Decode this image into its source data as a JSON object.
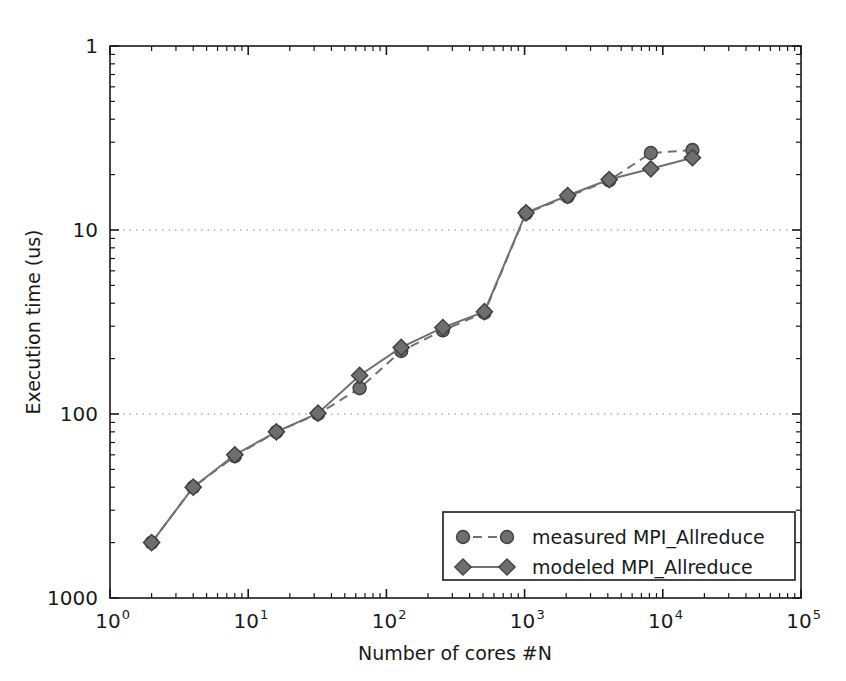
{
  "chart_data": {
    "type": "line",
    "title": "",
    "xlabel": "Number of cores #N",
    "ylabel": "Execution time (us)",
    "xscale": "log",
    "yscale": "log",
    "xlim": [
      1,
      100000
    ],
    "ylim": [
      1,
      1000
    ],
    "grid": "horizontal dotted at y=10 and y=100",
    "legend_position": "lower right",
    "xticklabels": [
      "10^0",
      "10^1",
      "10^2",
      "10^3",
      "10^4",
      "10^5"
    ],
    "xtickvalues": [
      1,
      10,
      100,
      1000,
      10000,
      100000
    ],
    "yticklabels": [
      "1",
      "10",
      "100",
      "1000"
    ],
    "ytickvalues": [
      1,
      10,
      100,
      1000
    ],
    "series": [
      {
        "name": "measured MPI_Allreduce",
        "marker": "circle",
        "linestyle": "dashed",
        "color": "#6e6e6e",
        "x": [
          2,
          4,
          8,
          16,
          32,
          64,
          128,
          256,
          512,
          1024,
          2048,
          4096,
          8192,
          16384
        ],
        "y": [
          2.0,
          4.0,
          5.9,
          8.0,
          10.0,
          13.8,
          22.0,
          28.5,
          35.5,
          123.0,
          152.0,
          186.0,
          262.0,
          272.0
        ]
      },
      {
        "name": "modeled MPI_Allreduce",
        "marker": "diamond",
        "linestyle": "solid",
        "color": "#6e6e6e",
        "x": [
          2,
          4,
          8,
          16,
          32,
          64,
          128,
          256,
          512,
          1024,
          2048,
          4096,
          8192,
          16384
        ],
        "y": [
          2.0,
          4.0,
          6.0,
          8.0,
          10.1,
          16.2,
          23.0,
          29.5,
          36.0,
          124.0,
          154.0,
          188.0,
          215.0,
          247.0
        ]
      }
    ]
  },
  "axes": {
    "x_label": "Number of cores #N",
    "y_label": "Execution time (us)",
    "y_ticks": [
      "1000",
      "100",
      "10",
      "1"
    ],
    "x_ticks": [
      {
        "mantissa": "10",
        "exponent": "0"
      },
      {
        "mantissa": "10",
        "exponent": "1"
      },
      {
        "mantissa": "10",
        "exponent": "2"
      },
      {
        "mantissa": "10",
        "exponent": "3"
      },
      {
        "mantissa": "10",
        "exponent": "4"
      },
      {
        "mantissa": "10",
        "exponent": "5"
      }
    ]
  },
  "legend": {
    "entries": [
      {
        "label": "measured MPI_Allreduce",
        "marker": "circle",
        "dash": "dashed"
      },
      {
        "label": "modeled MPI_Allreduce",
        "marker": "diamond",
        "dash": "solid"
      }
    ]
  },
  "colors": {
    "marker_face": "#6e6e6e",
    "marker_edge": "#404040",
    "line": "#707070",
    "axis": "#1a1a1a",
    "grid": "#8a8a8a",
    "background": "#ffffff"
  }
}
